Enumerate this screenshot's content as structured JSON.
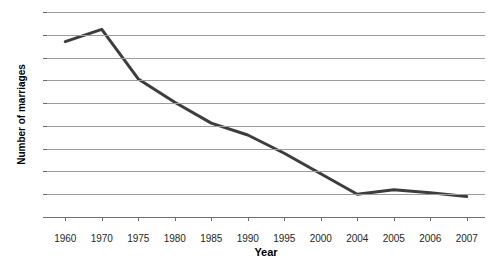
{
  "chart_data": {
    "type": "line",
    "title": "",
    "xlabel": "Year",
    "ylabel": "Number of marriages",
    "categories": [
      "1960",
      "1970",
      "1975",
      "1980",
      "1985",
      "1990",
      "1995",
      "2000",
      "2004",
      "2005",
      "2006",
      "2007"
    ],
    "values": [
      73.5,
      76.2,
      65.3,
      60.2,
      55.6,
      53.0,
      49.0,
      44.5,
      40.0,
      41.0,
      40.3,
      39.5
    ],
    "series": [
      {
        "name": "Number of marriages",
        "values": [
          73.5,
          76.2,
          65.3,
          60.2,
          55.6,
          53.0,
          49.0,
          44.5,
          40.0,
          41.0,
          40.3,
          39.5
        ]
      }
    ],
    "ylim": [
      35,
      80
    ],
    "ytick_step": 5,
    "yticks": [
      35,
      40,
      45,
      50,
      55,
      60,
      65,
      70,
      75,
      80
    ],
    "grid": true,
    "legend": "none",
    "line_color": "#3d3d3d",
    "grid_color": "#9b9b9b",
    "axis_color": "#6e6e6e",
    "background": "#ffffff"
  }
}
